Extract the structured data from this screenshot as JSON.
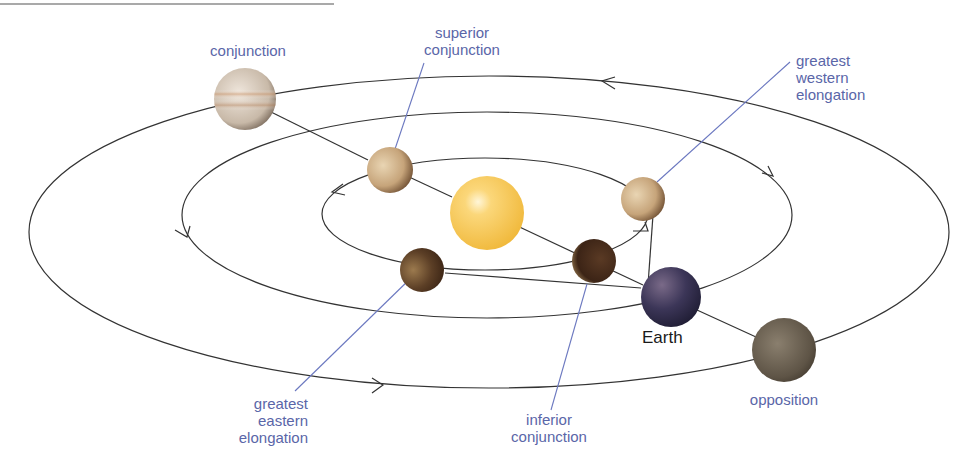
{
  "diagram": {
    "labels": {
      "conjunction": [
        "conjunction"
      ],
      "superior_conjunction": [
        "superior",
        "conjunction"
      ],
      "greatest_western_elongation": [
        "greatest",
        "western",
        "elongation"
      ],
      "greatest_eastern_elongation": [
        "greatest",
        "eastern",
        "elongation"
      ],
      "inferior_conjunction": [
        "inferior",
        "conjunction"
      ],
      "opposition": [
        "opposition"
      ],
      "earth": "Earth"
    },
    "colors": {
      "label": "#5a66a8",
      "leader_line": "#6b78c0",
      "orbit": "#333333",
      "sun": "#f7c54a",
      "venus": "#c7a57a",
      "venus_dark": "#4a3020",
      "jupiter": "#cfc4b8",
      "earth": "#3a3555",
      "superior_planet": "#6e6354"
    },
    "bodies": [
      {
        "name": "Sun",
        "cx": 487,
        "cy": 213,
        "r": 37
      },
      {
        "name": "Jupiter at conjunction",
        "cx": 245,
        "cy": 99,
        "r": 31
      },
      {
        "name": "Venus at superior conjunction",
        "cx": 390,
        "cy": 170,
        "r": 23
      },
      {
        "name": "Venus at greatest western elongation",
        "cx": 643,
        "cy": 199,
        "r": 22
      },
      {
        "name": "Venus at inferior conjunction",
        "cx": 594,
        "cy": 261,
        "r": 22
      },
      {
        "name": "Venus at greatest eastern elongation",
        "cx": 422,
        "cy": 270,
        "r": 22
      },
      {
        "name": "Earth",
        "cx": 671,
        "cy": 297,
        "r": 30
      },
      {
        "name": "Superior planet at opposition",
        "cx": 784,
        "cy": 350,
        "r": 32
      }
    ],
    "orbits": [
      {
        "name": "inner-orbit",
        "cx": 485,
        "cy": 214,
        "rx": 163,
        "ry": 56
      },
      {
        "name": "middle-orbit",
        "cx": 487,
        "cy": 215,
        "rx": 305,
        "ry": 103
      },
      {
        "name": "outer-orbit",
        "cx": 489,
        "cy": 232,
        "rx": 460,
        "ry": 156
      }
    ]
  }
}
